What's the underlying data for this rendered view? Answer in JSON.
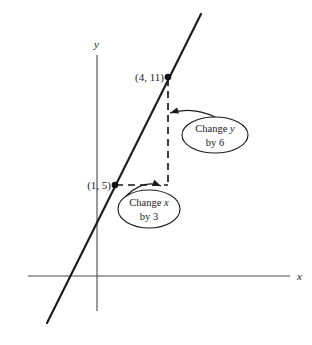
{
  "figure": {
    "background_color": "#ffffff",
    "stroke_color": "#1a1a1a",
    "axis_color": "#4a4a4a",
    "width": 312,
    "height": 345
  },
  "axes": {
    "x_label": "x",
    "y_label": "y",
    "x_axis": {
      "x1": 28,
      "y1": 276,
      "x2": 290,
      "y2": 276
    },
    "y_axis": {
      "x1": 97,
      "y1": 55,
      "x2": 97,
      "y2": 311
    },
    "x_label_pos": {
      "x": 297,
      "y": 280
    },
    "y_label_pos": {
      "x": 94,
      "y": 48
    }
  },
  "line": {
    "name": "plotted-line",
    "x1": 47,
    "y1": 323,
    "x2": 201,
    "y2": 14
  },
  "points": [
    {
      "name": "point-4-11",
      "label": "(4, 11)",
      "cx": 168,
      "cy": 77,
      "label_x": 164,
      "label_y": 81,
      "label_anchor": "end"
    },
    {
      "name": "point-1-5",
      "label": "(1, 5)",
      "cx": 115,
      "cy": 185,
      "label_x": 111,
      "label_y": 189,
      "label_anchor": "end"
    }
  ],
  "dashed_segments": [
    {
      "name": "vertical-rise-segment",
      "x1": 168,
      "y1": 79,
      "x2": 168,
      "y2": 185
    },
    {
      "name": "horizontal-run-segment",
      "x1": 116,
      "y1": 185,
      "x2": 168,
      "y2": 185
    }
  ],
  "callouts": [
    {
      "name": "callout-change-y",
      "line1_prefix": "Change ",
      "line1_italic": "y",
      "line2": "by 6",
      "cx": 215,
      "cy": 135,
      "rx": 33,
      "ry": 18,
      "text1_x": 215,
      "text1_y": 132,
      "text2_x": 215,
      "text2_y": 146,
      "arrow": {
        "tail_x": 215,
        "tail_y": 117,
        "tip_x": 170,
        "tip_y": 113
      }
    },
    {
      "name": "callout-change-x",
      "line1_prefix": "Change ",
      "line1_italic": "x",
      "line2": "by 3",
      "cx": 149,
      "cy": 209,
      "rx": 31,
      "ry": 19,
      "text1_x": 149,
      "text1_y": 206,
      "text2_x": 149,
      "text2_y": 220,
      "arrow": {
        "tail_x": 126,
        "tail_y": 196,
        "tip_x": 161,
        "tip_y": 186
      }
    }
  ]
}
